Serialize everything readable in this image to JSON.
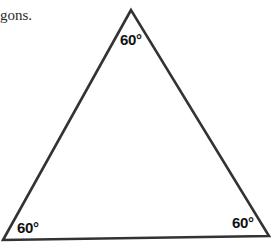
{
  "caption": {
    "text": "gons."
  },
  "triangle": {
    "type": "equilateral",
    "stroke_color": "#333333",
    "vertices": {
      "apex": [
        131,
        10
      ],
      "bottom_left": [
        3,
        240
      ],
      "bottom_right": [
        269,
        236
      ]
    },
    "angles": {
      "top": "60°",
      "bottom_left": "60°",
      "bottom_right": "60°"
    }
  }
}
